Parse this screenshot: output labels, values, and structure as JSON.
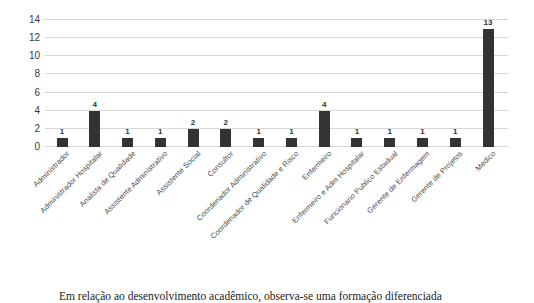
{
  "chart_data": {
    "type": "bar",
    "title": "",
    "xlabel": "",
    "ylabel": "",
    "ylim": [
      0,
      14
    ],
    "yticks": [
      0,
      2,
      4,
      6,
      8,
      10,
      12,
      14
    ],
    "grid": true,
    "legend": null,
    "bar_color": "#333333",
    "gridline_color": "#d7d7d7",
    "categories": [
      "Administrador",
      "Administrador Hospitalar",
      "Analista de Qualidade",
      "Assistente Administrativo",
      "Assistente Social",
      "Consultor",
      "Coordenador Administrativo",
      "Coordenador de Qualidade e Risco",
      "Enfermeiro",
      "Enfermeiro e Adm Hospitalar",
      "Funcionario Publico Estadual",
      "Gerente de Enfermagem",
      "Gerente de Projetos",
      "Medico"
    ],
    "values": [
      1,
      4,
      1,
      1,
      2,
      2,
      1,
      1,
      4,
      1,
      1,
      1,
      1,
      13
    ],
    "data_labels": [
      "1",
      "4",
      "1",
      "1",
      "2",
      "2",
      "1",
      "1",
      "4",
      "1",
      "1",
      "1",
      "1",
      "13"
    ]
  },
  "caption": {
    "text": "Em relação ao desenvolvimento acadêmico, observa-se uma formação diferenciada"
  }
}
